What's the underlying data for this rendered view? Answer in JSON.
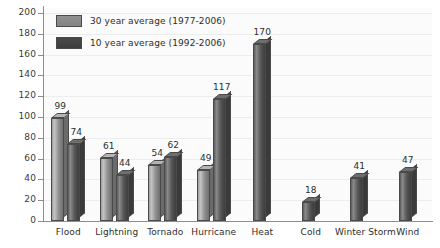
{
  "chart_data": {
    "type": "bar",
    "title": "",
    "subtitle": "",
    "xlabel": "",
    "ylabel": "",
    "ylim": [
      0,
      200
    ],
    "ytick_step": 20,
    "yticks": [
      0,
      20,
      40,
      60,
      80,
      100,
      120,
      140,
      160,
      180,
      200
    ],
    "grid": true,
    "legend_position": "top-left",
    "categories": [
      "Flood",
      "Lightning",
      "Tornado",
      "Hurricane",
      "Heat",
      "Cold",
      "Winter Storm",
      "Wind"
    ],
    "series": [
      {
        "name": "30 year average (1977-2006)",
        "color": "#8e8e8e",
        "values": [
          99,
          61,
          54,
          49,
          null,
          null,
          null,
          null
        ]
      },
      {
        "name": "10 year average (1992-2006)",
        "color": "#444444",
        "values": [
          74,
          44,
          62,
          117,
          170,
          18,
          41,
          47
        ]
      }
    ],
    "data_labels": [
      [
        "99",
        "74"
      ],
      [
        "61",
        "44"
      ],
      [
        "54",
        "62"
      ],
      [
        "49",
        "117"
      ],
      [
        "170"
      ],
      [
        "18"
      ],
      [
        "41"
      ],
      [
        "47"
      ]
    ]
  },
  "legend": {
    "items": [
      {
        "label": "30 year average (1977-2006)",
        "swatch": "s30c"
      },
      {
        "label": "10 year average (1992-2006)",
        "swatch": "s10c"
      }
    ]
  },
  "axis": {
    "y_labels": [
      "200",
      "180",
      "160",
      "140",
      "120",
      "100",
      "80",
      "60",
      "40",
      "20",
      "0"
    ]
  }
}
